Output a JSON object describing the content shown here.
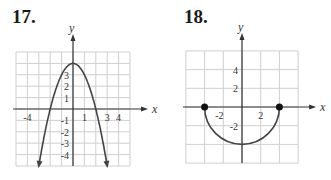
{
  "problems": [
    {
      "number": "17."
    },
    {
      "number": "18."
    }
  ],
  "chart_data": [
    {
      "type": "line",
      "title": "17.",
      "xlabel": "x",
      "ylabel": "y",
      "xlim": [
        -5,
        5
      ],
      "ylim": [
        -5,
        5
      ],
      "grid": true,
      "x_tick_labels": [
        "-4",
        "1",
        "3",
        "4"
      ],
      "y_tick_labels": [
        "3",
        "2",
        "1",
        "-1",
        "-2",
        "-3",
        "-4"
      ],
      "series": [
        {
          "name": "y = 4 - x^2 (downward parabola, arrows at ends)",
          "x": [
            -3,
            -2,
            -1,
            0,
            1,
            2,
            3
          ],
          "y": [
            -5,
            0,
            3,
            4,
            3,
            0,
            -5
          ]
        }
      ]
    },
    {
      "type": "line",
      "title": "18.",
      "xlabel": "x",
      "ylabel": "y",
      "xlim": [
        -6,
        6
      ],
      "ylim": [
        -6,
        6
      ],
      "grid": true,
      "grid_step": 2,
      "x_tick_labels": [
        "-2",
        "2"
      ],
      "y_tick_labels": [
        "4",
        "2",
        "-2"
      ],
      "series": [
        {
          "name": "lower semicircle radius 4 with closed endpoints",
          "x": [
            -4,
            -2,
            0,
            2,
            4
          ],
          "y": [
            0,
            -3.46,
            -4,
            -3.46,
            0
          ],
          "endpoints": [
            [
              -4,
              0
            ],
            [
              4,
              0
            ]
          ]
        }
      ]
    }
  ]
}
